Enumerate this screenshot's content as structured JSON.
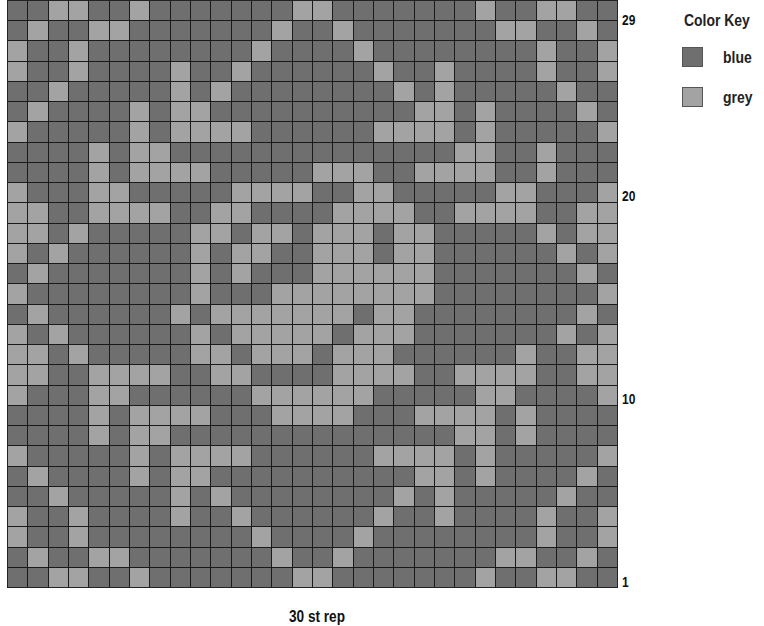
{
  "chart": {
    "type": "colorwork-chart",
    "columns": 30,
    "rows": 29,
    "row_labels": [
      {
        "label": "29",
        "row": 29
      },
      {
        "label": "20",
        "row": 20
      },
      {
        "label": "10",
        "row": 10
      },
      {
        "label": "1",
        "row": 1
      }
    ],
    "footer": "30 st rep",
    "grid_top_to_bottom": [
      "BBGGBBGBBBBBBBGGBBBBBBBGBBGGBB",
      "BGBBGGBBBBBBBGBBGBBBBBBBGGBBGB",
      "GBBGBBBBBBBBGBBBBGBBBBBBBBGBBG",
      "GBBGBBBBGBBGBBBBBBGBBGBBBBGBBG",
      "BBGBBBBBGBGBBBBBBBBGBGBBBBBGBB",
      "BGBBBBGBGGBBBBBBBBBBGGBGBBBBGB",
      "GBBBBBGBGGGGBBBBBBGGGGBGBBBBBG",
      "BBBBGBGGBBBBBBBBBBBBBBGGBBGBBB",
      "BBBBGBGGGGBBBBBGGGBBGGGGBBGBBB",
      "GBBBGGBBBBBGGGGBBGGBBBBBGGBBBG",
      "GGBBGGGGBBGGBBBBGGGGBBGGGGBBGG",
      "GGBGBBBBBGGBGGBGGGBGGBBBBBGBGG",
      "GBGBBBBBBGBGGBBGGGBGGBBBBBBGBG",
      "BGBBBBBBBGBGBBBGGGGGGBBBBBBBGB",
      "GBBBBBBBBGBBBGGGGGGGGBBBBBBBBG",
      "BGBBBBBBGBGGGGGGGBGGBBBBBBBBGB",
      "GBGBBBBBBGBGGGGGBGGGBBBBBBBGBG",
      "GGBGBBBBBGGBGGGBGGGBBBBBBGBBGG",
      "GGBBGGGGBBGGBBBBGGGGBBGGGGBBGG",
      "GBBBGGBBBBBBGGGGGGBBBBBGGBBBBG",
      "BBBBGBGGGGBBBGGGGBBBGGGGBGBBBB",
      "BBBBGBGGBBBBBBBBBBBBBBGGBGBBBB",
      "GBBBBBGBGGGGBBBBBBGGGGBGBBBBBG",
      "BGBBBBGBGGBBBBBBBBBBGGBGBBBBGB",
      "BBGBBBBBGBGBBBBBBBBGBGBBBBBGBB",
      "GBBGBBBBGBBGBBBBBBGBBGBBBBGBBG",
      "GBBGBBBBBBBBGBBBBGBBBBBBBBGBBG",
      "BGBBGGBBBBBBBGBBGBBBBBBBGGBBGB",
      "BBGGBBGBBBBBBBGGBBBBBBBGBBGGBB"
    ]
  },
  "color_key": {
    "title": "Color Key",
    "items": [
      {
        "code": "B",
        "label": "blue",
        "color": "#6f6f6f"
      },
      {
        "code": "G",
        "label": "grey",
        "color": "#a3a3a3"
      }
    ]
  }
}
